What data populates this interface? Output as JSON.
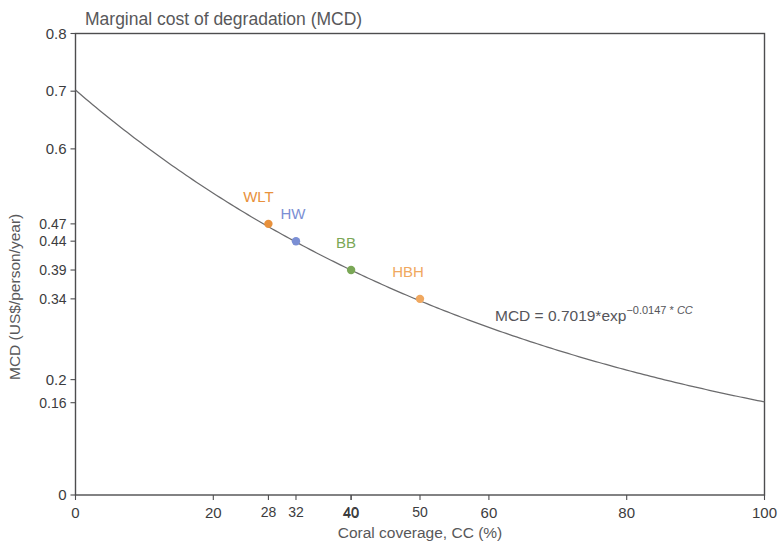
{
  "chart_data": {
    "type": "line",
    "title": "Marginal cost of degradation (MCD)",
    "xlabel": "Coral coverage, CC (%)",
    "ylabel": "MCD (US$/person/year)",
    "xlim": [
      0,
      100
    ],
    "ylim": [
      0,
      0.8
    ],
    "grid": false,
    "legend": "none",
    "equation": {
      "full": "MCD = 0.7019*exp^(-0.0147 * CC)",
      "lead": "MCD = 0.7019*exp",
      "exponent": "−0.0147 * ",
      "exponent_var": "CC",
      "coefficient": 0.7019,
      "rate": -0.0147
    },
    "x_ticks_major": [
      {
        "value": 0,
        "label": "0",
        "color": "#2b2b2d"
      },
      {
        "value": 20,
        "label": "20",
        "color": "#2b2b2d"
      },
      {
        "value": 40,
        "label": "40",
        "color": "#2b2b2d"
      },
      {
        "value": 60,
        "label": "60",
        "color": "#2b2b2d"
      },
      {
        "value": 80,
        "label": "80",
        "color": "#2b2b2d"
      },
      {
        "value": 100,
        "label": "100",
        "color": "#2b2b2d"
      }
    ],
    "x_ticks_highlight": [
      {
        "value": 28,
        "label": "28",
        "color": "#e8913c"
      },
      {
        "value": 32,
        "label": "32",
        "color": "#7b8fd4"
      },
      {
        "value": 40,
        "label": "40",
        "color": "#7aa756"
      },
      {
        "value": 50,
        "label": "50",
        "color": "#f0a860"
      }
    ],
    "y_ticks_major": [
      {
        "value": 0,
        "label": "0",
        "color": "#2b2b2d"
      },
      {
        "value": 0.2,
        "label": "0.2",
        "color": "#2b2b2d"
      },
      {
        "value": 0.6,
        "label": "0.6",
        "color": "#2b2b2d"
      },
      {
        "value": 0.7,
        "label": "0.7",
        "color": "#2b2b2d"
      },
      {
        "value": 0.8,
        "label": "0.8",
        "color": "#2b2b2d"
      }
    ],
    "y_ticks_highlight": [
      {
        "value": 0.47,
        "label": "0.47",
        "color": "#e8913c"
      },
      {
        "value": 0.44,
        "label": "0.44",
        "color": "#7b8fd4"
      },
      {
        "value": 0.39,
        "label": "0.39",
        "color": "#7aa756"
      },
      {
        "value": 0.34,
        "label": "0.34",
        "color": "#f0a860"
      },
      {
        "value": 0.16,
        "label": "0.16",
        "color": "#2b2b2d"
      }
    ],
    "points": [
      {
        "name": "WLT",
        "x": 28,
        "y": 0.47,
        "color": "#e8913c",
        "label_dx": -10,
        "label_dy": -22
      },
      {
        "name": "HW",
        "x": 32,
        "y": 0.44,
        "color": "#7b8fd4",
        "label_dx": -3,
        "label_dy": -22
      },
      {
        "name": "BB",
        "x": 40,
        "y": 0.39,
        "color": "#7aa756",
        "label_dx": -5,
        "label_dy": -22
      },
      {
        "name": "HBH",
        "x": 50,
        "y": 0.34,
        "color": "#f0a860",
        "label_dx": -12,
        "label_dy": -22
      }
    ]
  }
}
